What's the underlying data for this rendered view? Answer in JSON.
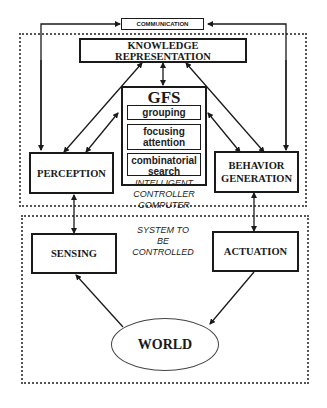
{
  "diagram": {
    "communication": "COMMUNICATION",
    "knowledge_representation": "KNOWLEDGE REPRESENTATION",
    "gfs": {
      "title": "GFS",
      "items": [
        "grouping",
        "focusing attention",
        "combinatorial search"
      ]
    },
    "perception": "PERCEPTION",
    "behavior_generation": "BEHAVIOR GENERATION",
    "controller_label": "INTELLIGENT CONTROLLER COMPUTER",
    "system_label": "SYSTEM TO BE CONTROLLED",
    "sensing": "SENSING",
    "actuation": "ACTUATION",
    "world": "WORLD"
  }
}
